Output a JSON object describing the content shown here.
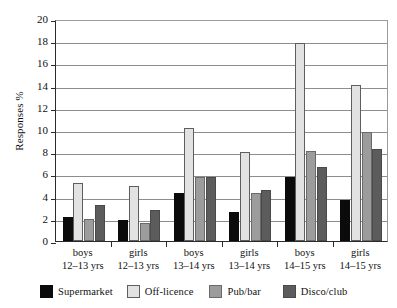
{
  "chart_data": {
    "type": "bar",
    "title": "",
    "subtitle": "",
    "xlabel": "",
    "ylabel": "Responses %",
    "ylim": [
      0,
      20
    ],
    "ytick_step": 2,
    "yticks": [
      20,
      18,
      16,
      14,
      12,
      10,
      8,
      6,
      4,
      2,
      0
    ],
    "grid": true,
    "legend_position": "bottom",
    "categories": [
      "boys 12–13 yrs",
      "girls 12–13 yrs",
      "boys 13–14 yrs",
      "girls 13–14 yrs",
      "boys 14–15 yrs",
      "girls 14–15 yrs"
    ],
    "category_lines": [
      {
        "line1": "boys",
        "line2": "12–13 yrs"
      },
      {
        "line1": "girls",
        "line2": "12–13 yrs"
      },
      {
        "line1": "boys",
        "line2": "13–14 yrs"
      },
      {
        "line1": "girls",
        "line2": "13–14 yrs"
      },
      {
        "line1": "boys",
        "line2": "14–15 yrs"
      },
      {
        "line1": "girls",
        "line2": "14–15 yrs"
      }
    ],
    "series": [
      {
        "name": "Supermarket",
        "color": "#0b0b0b",
        "values": [
          2.2,
          1.9,
          4.3,
          2.6,
          5.8,
          3.7
        ]
      },
      {
        "name": "Off-licence",
        "color": "#e2e2e2",
        "values": [
          5.2,
          5.0,
          10.2,
          8.0,
          17.8,
          14.1
        ]
      },
      {
        "name": "Pub/bar",
        "color": "#9c9c9c",
        "values": [
          2.0,
          1.6,
          5.8,
          4.3,
          8.1,
          9.8
        ]
      },
      {
        "name": "Disco/club",
        "color": "#5c5c5c",
        "values": [
          3.2,
          2.8,
          5.8,
          4.6,
          6.7,
          8.3
        ]
      }
    ]
  },
  "legend": {
    "items": [
      {
        "label": "Supermarket"
      },
      {
        "label": "Off-licence"
      },
      {
        "label": "Pub/bar"
      },
      {
        "label": "Disco/club"
      }
    ]
  }
}
